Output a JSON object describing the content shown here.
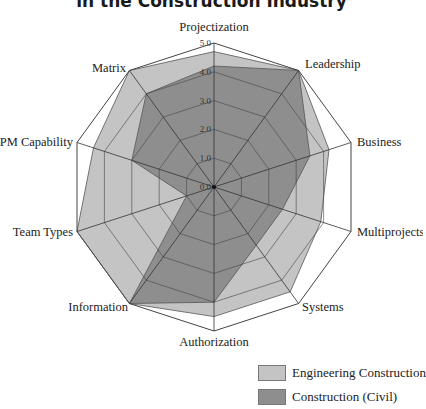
{
  "chart_data": {
    "type": "radar",
    "title": "in the Construction Industry",
    "axes": [
      "Projectization",
      "Leadership",
      "Business",
      "Multiprojects",
      "Systems",
      "Authorization",
      "Information",
      "Team Types",
      "PM Capability",
      "Matrix"
    ],
    "ticks": [
      "0.0",
      "1.0",
      "2.0",
      "3.0",
      "4.0",
      "5.0"
    ],
    "range": [
      0,
      5
    ],
    "grid": true,
    "legend_position": "bottom-right",
    "series": [
      {
        "name": "Engineering Construction",
        "color": "#c4c4c4",
        "values": [
          4.7,
          5.0,
          4.2,
          3.9,
          4.5,
          4.5,
          5.0,
          5.0,
          4.4,
          5.0
        ]
      },
      {
        "name": "Construction (Civil)",
        "color": "#8e8e8e",
        "values": [
          4.2,
          5.0,
          3.5,
          2.5,
          2.5,
          4.0,
          5.0,
          1.0,
          3.0,
          4.0
        ]
      }
    ]
  },
  "title": "in the Construction Industry",
  "legend": [
    {
      "label": "Engineering Construction",
      "color": "#c4c4c4"
    },
    {
      "label": "Construction (Civil)",
      "color": "#8e8e8e"
    }
  ]
}
